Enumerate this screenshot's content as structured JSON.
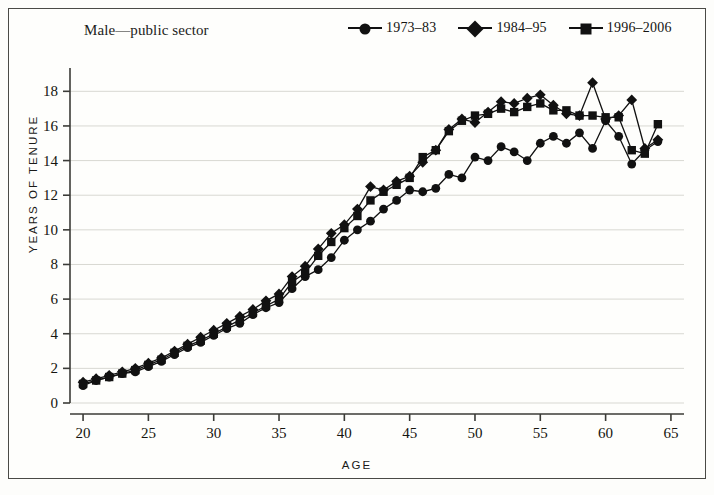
{
  "figure": {
    "title": "Male—public sector",
    "xlabel": "AGE",
    "ylabel": "YEARS OF TENURE"
  },
  "legend": [
    {
      "label": "1973–83",
      "marker": "circle"
    },
    {
      "label": "1984–95",
      "marker": "diamond"
    },
    {
      "label": "1996–2006",
      "marker": "square"
    }
  ],
  "axes": {
    "x_ticks": [
      "20",
      "25",
      "30",
      "35",
      "40",
      "45",
      "50",
      "55",
      "60",
      "65"
    ],
    "y_ticks": [
      "0",
      "2",
      "4",
      "6",
      "8",
      "10",
      "12",
      "14",
      "16",
      "18"
    ]
  },
  "colors": {
    "ink": "#111111",
    "grid": "#d8d8d2",
    "frame": "#4a4a46",
    "background": "#fefefc"
  },
  "chart_data": {
    "type": "line",
    "title": "Male—public sector",
    "xlabel": "AGE",
    "ylabel": "YEARS OF TENURE",
    "xlim": [
      19,
      66
    ],
    "ylim": [
      0,
      19
    ],
    "x_ticks": [
      20,
      25,
      30,
      35,
      40,
      45,
      50,
      55,
      60,
      65
    ],
    "y_ticks": [
      0,
      2,
      4,
      6,
      8,
      10,
      12,
      14,
      16,
      18
    ],
    "grid": "horizontal",
    "legend_position": "top-right",
    "x": [
      20,
      21,
      22,
      23,
      24,
      25,
      26,
      27,
      28,
      29,
      30,
      31,
      32,
      33,
      34,
      35,
      36,
      37,
      38,
      39,
      40,
      41,
      42,
      43,
      44,
      45,
      46,
      47,
      48,
      49,
      50,
      51,
      52,
      53,
      54,
      55,
      56,
      57,
      58,
      59,
      60,
      61,
      62,
      63,
      64
    ],
    "series": [
      {
        "name": "1973–83",
        "marker": "circle",
        "values": [
          1.0,
          1.3,
          1.5,
          1.7,
          1.8,
          2.1,
          2.4,
          2.8,
          3.2,
          3.5,
          3.9,
          4.3,
          4.6,
          5.1,
          5.5,
          5.8,
          6.6,
          7.3,
          7.7,
          8.4,
          9.4,
          10.0,
          10.5,
          11.2,
          11.7,
          12.3,
          12.2,
          12.4,
          13.2,
          13.0,
          14.2,
          14.0,
          14.8,
          14.5,
          14.0,
          15.0,
          15.4,
          15.0,
          15.6,
          14.7,
          16.3,
          15.4,
          13.8,
          14.6,
          15.1
        ]
      },
      {
        "name": "1984–95",
        "marker": "diamond",
        "values": [
          1.2,
          1.4,
          1.6,
          1.8,
          2.0,
          2.3,
          2.6,
          3.0,
          3.4,
          3.8,
          4.2,
          4.6,
          5.0,
          5.4,
          5.9,
          6.3,
          7.3,
          7.9,
          8.9,
          9.8,
          10.3,
          11.2,
          12.5,
          12.3,
          12.8,
          13.1,
          13.9,
          14.6,
          15.8,
          16.4,
          16.2,
          16.8,
          17.4,
          17.3,
          17.6,
          17.8,
          17.2,
          16.7,
          16.6,
          18.5,
          16.4,
          16.6,
          17.5,
          14.7,
          15.2
        ]
      },
      {
        "name": "1996–2006",
        "marker": "square",
        "values": [
          1.1,
          1.3,
          1.5,
          1.7,
          1.9,
          2.2,
          2.5,
          2.9,
          3.3,
          3.6,
          4.0,
          4.4,
          4.8,
          5.2,
          5.6,
          6.0,
          7.0,
          7.5,
          8.5,
          9.3,
          10.1,
          10.8,
          11.7,
          12.2,
          12.6,
          13.0,
          14.2,
          14.6,
          15.7,
          16.3,
          16.6,
          16.7,
          17.0,
          16.8,
          17.1,
          17.3,
          16.9,
          16.9,
          16.6,
          16.6,
          16.5,
          16.5,
          14.6,
          14.4,
          16.1
        ]
      }
    ]
  }
}
